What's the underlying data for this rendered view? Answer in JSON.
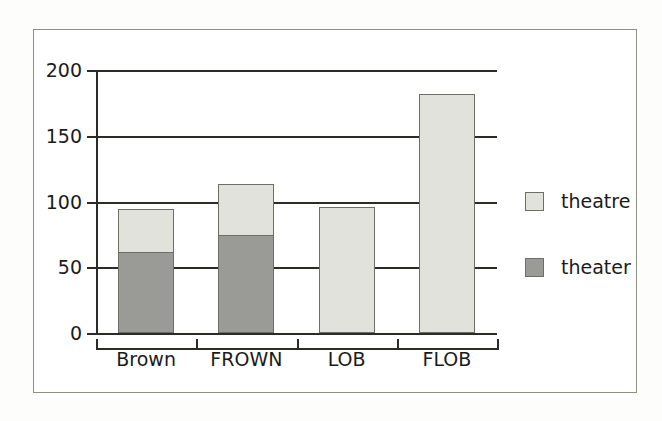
{
  "chart_data": {
    "type": "bar",
    "subtype": "stacked",
    "title": "",
    "subtitle": "",
    "xlabel": "",
    "ylabel": "",
    "categories": [
      "Brown",
      "FROWN",
      "LOB",
      "FLOB"
    ],
    "series": [
      {
        "name": "theater",
        "color": "#9a9a96",
        "values": [
          61,
          74,
          0,
          0
        ]
      },
      {
        "name": "theatre",
        "color": "#e2e2dc",
        "values": [
          33,
          39,
          96,
          182
        ]
      }
    ],
    "totals": [
      94,
      113,
      96,
      182
    ],
    "ylim": [
      0,
      200
    ],
    "yticks": [
      0,
      50,
      100,
      150,
      200
    ],
    "ytick_labels": [
      "0",
      "50",
      "100",
      "150",
      "200"
    ],
    "grid": true,
    "grid_axis": "y",
    "legend_position": "right",
    "legend_entries": [
      {
        "label": "theatre",
        "color": "#e2e2dc"
      },
      {
        "label": "theater",
        "color": "#9a9a96"
      }
    ],
    "colors": {
      "axis": "#2b2b28",
      "frame": "#8f8f86",
      "bar_edge": "#6e6e66",
      "background": "#ffffff",
      "theatre_fill": "#e2e2dc",
      "theater_fill": "#9a9a96"
    }
  }
}
